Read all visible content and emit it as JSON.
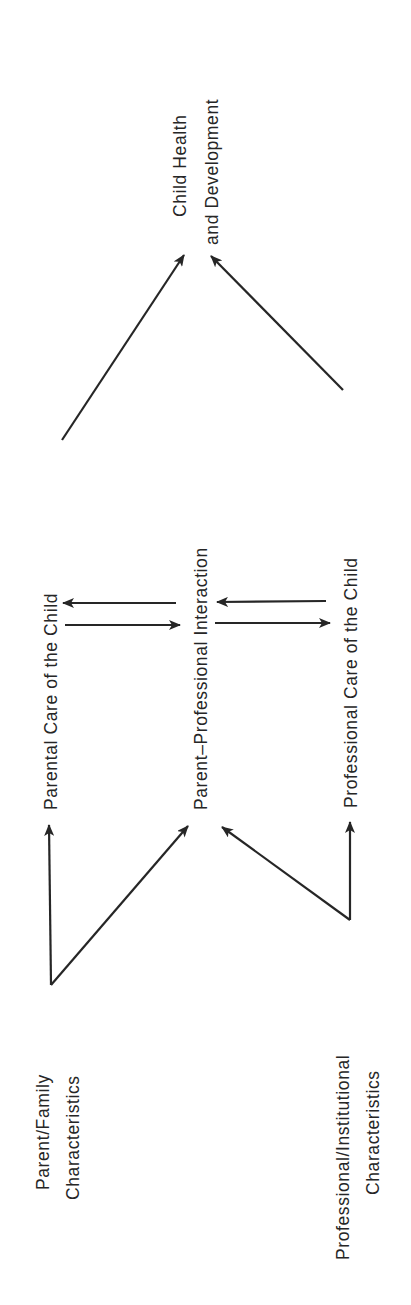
{
  "diagram": {
    "orientation": "rotated-90-ccw",
    "nodes": {
      "parent_family": {
        "line1": "Parent/Family",
        "line2": "Characteristics"
      },
      "professional_institutional": {
        "line1": "Professional/Institutional",
        "line2": "Characteristics"
      },
      "parental_care": {
        "label": "Parental Care of the Child"
      },
      "parent_professional_interaction": {
        "label": "Parent–Professional Interaction"
      },
      "professional_care": {
        "label": "Professional Care of the Child"
      },
      "child_health": {
        "line1": "Child Health",
        "line2": "and Development"
      }
    },
    "edges": [
      {
        "from": "Parent/Family Characteristics",
        "to": "Parental Care of the Child"
      },
      {
        "from": "Parent/Family Characteristics",
        "to": "Parent–Professional Interaction"
      },
      {
        "from": "Professional/Institutional Characteristics",
        "to": "Professional Care of the Child"
      },
      {
        "from": "Professional/Institutional Characteristics",
        "to": "Parent–Professional Interaction"
      },
      {
        "from": "Parental Care of the Child",
        "to": "Parent–Professional Interaction"
      },
      {
        "from": "Parent–Professional Interaction",
        "to": "Parental Care of the Child"
      },
      {
        "from": "Parent–Professional Interaction",
        "to": "Professional Care of the Child"
      },
      {
        "from": "Professional Care of the Child",
        "to": "Parent–Professional Interaction"
      },
      {
        "from": "Parental Care of the Child",
        "to": "Child Health and Development"
      },
      {
        "from": "Professional Care of the Child",
        "to": "Child Health and Development"
      }
    ],
    "colors": {
      "ink": "#262626",
      "background": "#ffffff"
    }
  }
}
